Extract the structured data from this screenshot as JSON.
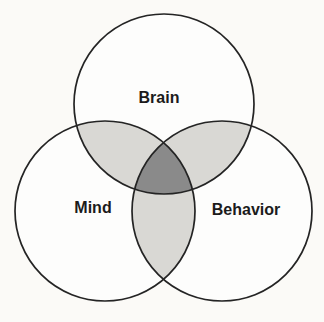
{
  "figure": {
    "type": "venn_diagram",
    "sets": [
      {
        "label": "Brain"
      },
      {
        "label": "Mind"
      },
      {
        "label": "Behavior"
      }
    ],
    "colors": {
      "background": "#fbfaf7",
      "circle_fill": "#fdfdfc",
      "pair_overlap": "#d9d8d4",
      "triple_overlap": "#8a8a8a",
      "outline": "#242424",
      "label_text": "#1b1b1b"
    }
  }
}
